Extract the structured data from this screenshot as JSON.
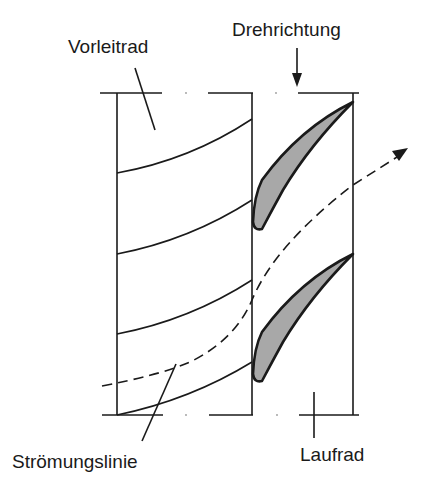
{
  "labels": {
    "guide_vane": "Vorleitrad",
    "rotation": "Drehrichtung",
    "streamline": "Strömungslinie",
    "rotor": "Laufrad"
  },
  "colors": {
    "line": "#1a1a1a",
    "blade_fill": "#a8a8a8",
    "background": "#ffffff"
  }
}
